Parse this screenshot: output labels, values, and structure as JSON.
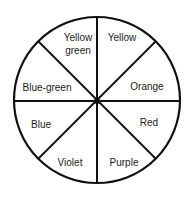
{
  "diagram": {
    "type": "color-wheel",
    "segments": [
      {
        "label": "Yellow",
        "x": 122,
        "y": 38
      },
      {
        "label": "Orange",
        "x": 147,
        "y": 87
      },
      {
        "label": "Red",
        "x": 149,
        "y": 123
      },
      {
        "label": "Purple",
        "x": 124,
        "y": 163
      },
      {
        "label": "Violet",
        "x": 70,
        "y": 163
      },
      {
        "label": "Blue",
        "x": 41,
        "y": 125
      },
      {
        "label": "Blue-green",
        "x": 47,
        "y": 88
      },
      {
        "label": "Yellow\ngreen",
        "x": 78,
        "y": 44
      }
    ]
  }
}
